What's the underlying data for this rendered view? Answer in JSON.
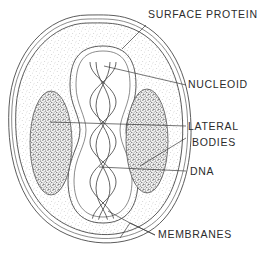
{
  "figure": {
    "kind": "poxvirus-virion-cross-section",
    "background_color": "#ffffff",
    "ink_color": "#3a3a3a",
    "labels": [
      {
        "id": "surface-protein",
        "text": "SURFACE PROTEIN",
        "x": 148,
        "y": 18
      },
      {
        "id": "nucleoid",
        "text": "NUCLEOID",
        "x": 188,
        "y": 88
      },
      {
        "id": "lateral-bodies-line1",
        "text": "LATERAL",
        "x": 188,
        "y": 130
      },
      {
        "id": "lateral-bodies-line2",
        "text": "BODIES",
        "x": 192,
        "y": 146
      },
      {
        "id": "dna",
        "text": "DNA",
        "x": 190,
        "y": 175
      },
      {
        "id": "membranes",
        "text": "MEMBRANES",
        "x": 158,
        "y": 238
      }
    ],
    "structures": [
      {
        "id": "outer-membrane",
        "name": "outer membrane"
      },
      {
        "id": "inner-membrane",
        "name": "inner membrane"
      },
      {
        "id": "cytoplasm-stipple",
        "name": "stippled cytoplasm"
      },
      {
        "id": "nucleoid-core",
        "name": "dumbbell nucleoid core"
      },
      {
        "id": "lateral-body-left",
        "name": "left lateral body"
      },
      {
        "id": "lateral-body-right",
        "name": "right lateral body"
      },
      {
        "id": "dna-helix",
        "name": "central DNA double helix"
      }
    ]
  }
}
